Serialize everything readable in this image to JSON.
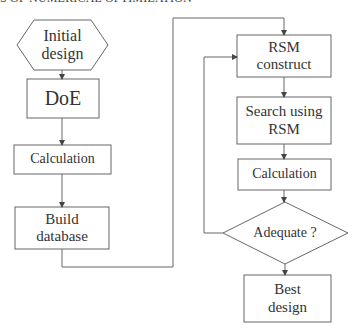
{
  "header": {
    "text": "S OF NUMERICAL OPTIMIZATION"
  },
  "colors": {
    "stroke": "#555555",
    "text": "#333333",
    "background": "#ffffff"
  },
  "nodes": {
    "initial_design": {
      "label_line1": "Initial",
      "label_line2": "design",
      "shape": "hexagon"
    },
    "doe": {
      "label": "DoE",
      "shape": "rectangle"
    },
    "calculation_left": {
      "label": "Calculation",
      "shape": "rectangle"
    },
    "build_database": {
      "label_line1": "Build",
      "label_line2": "database",
      "shape": "rectangle"
    },
    "rsm_construct": {
      "label_line1": "RSM",
      "label_line2": "construct",
      "shape": "rectangle"
    },
    "search_rsm": {
      "label_line1": "Search using",
      "label_line2": "RSM",
      "shape": "rectangle"
    },
    "calculation_right": {
      "label": "Calculation",
      "shape": "rectangle"
    },
    "adequate": {
      "label": "Adequate ?",
      "shape": "diamond"
    },
    "best_design": {
      "label_line1": "Best",
      "label_line2": "design",
      "shape": "rectangle"
    }
  },
  "edges": [
    {
      "from": "initial_design",
      "to": "doe"
    },
    {
      "from": "doe",
      "to": "calculation_left"
    },
    {
      "from": "calculation_left",
      "to": "build_database"
    },
    {
      "from": "build_database",
      "to": "rsm_construct"
    },
    {
      "from": "rsm_construct",
      "to": "search_rsm"
    },
    {
      "from": "search_rsm",
      "to": "calculation_right"
    },
    {
      "from": "calculation_right",
      "to": "adequate"
    },
    {
      "from": "adequate",
      "to": "rsm_construct",
      "note": "loop back (no)"
    },
    {
      "from": "adequate",
      "to": "best_design"
    }
  ]
}
